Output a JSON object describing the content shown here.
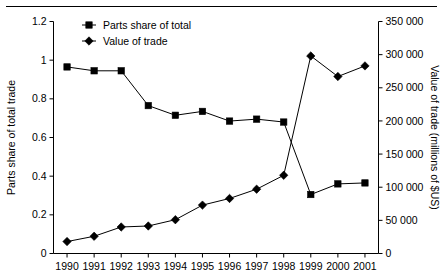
{
  "chart_data": {
    "type": "line",
    "title": "",
    "subtitle": "",
    "xlabel": "",
    "categories": [
      "1990",
      "1991",
      "1992",
      "1993",
      "1994",
      "1995",
      "1996",
      "1997",
      "1998",
      "1999",
      "2000",
      "2001"
    ],
    "grid": false,
    "legend_position": "top-left-inside",
    "axes": {
      "left": {
        "label": "Parts share of total trade",
        "ticks": [
          "0",
          "0.2",
          "0.4",
          "0.6",
          "0.8",
          "1",
          "1.2"
        ],
        "tick_values": [
          0,
          0.2,
          0.4,
          0.6,
          0.8,
          1,
          1.2
        ],
        "min": 0,
        "max": 1.2
      },
      "right": {
        "label": "Value of trade (millions of $US)",
        "ticks": [
          "0",
          "50 000",
          "100 000",
          "150 000",
          "200 000",
          "250 000",
          "300 000",
          "350 000"
        ],
        "tick_values": [
          0,
          50000,
          100000,
          150000,
          200000,
          250000,
          300000,
          350000
        ],
        "min": 0,
        "max": 350000
      }
    },
    "series": [
      {
        "name": "Parts share of total",
        "marker": "square",
        "axis": "left",
        "color": "#000000",
        "values": [
          0.965,
          0.945,
          0.945,
          0.765,
          0.715,
          0.735,
          0.685,
          0.695,
          0.68,
          0.305,
          0.36,
          0.365
        ]
      },
      {
        "name": "Value of trade",
        "marker": "diamond",
        "axis": "right",
        "color": "#000000",
        "values": [
          18000,
          26000,
          40000,
          41500,
          51000,
          73000,
          83000,
          97000,
          118000,
          298000,
          267000,
          283000
        ]
      }
    ]
  },
  "legend": {
    "items": [
      {
        "label": "Parts share of total",
        "marker": "square"
      },
      {
        "label": "Value of trade",
        "marker": "diamond"
      }
    ]
  }
}
